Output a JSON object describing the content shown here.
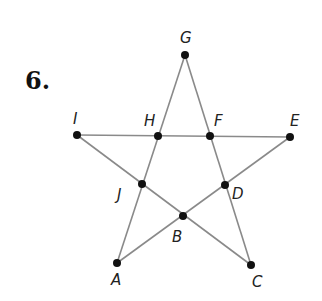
{
  "problem": {
    "number": "6."
  },
  "diagram": {
    "type": "pentagram",
    "line_color": "#8a8a8a",
    "point_color": "#111111",
    "points": [
      {
        "name": "G",
        "x": 185,
        "y": 55
      },
      {
        "name": "I",
        "x": 77,
        "y": 135
      },
      {
        "name": "H",
        "x": 158,
        "y": 136
      },
      {
        "name": "F",
        "x": 210,
        "y": 136
      },
      {
        "name": "E",
        "x": 290,
        "y": 137
      },
      {
        "name": "J",
        "x": 142,
        "y": 184
      },
      {
        "name": "D",
        "x": 225,
        "y": 185
      },
      {
        "name": "B",
        "x": 183,
        "y": 216
      },
      {
        "name": "A",
        "x": 117,
        "y": 263
      },
      {
        "name": "C",
        "x": 251,
        "y": 265
      }
    ],
    "segments": [
      [
        "G",
        "A"
      ],
      [
        "G",
        "C"
      ],
      [
        "I",
        "E"
      ],
      [
        "I",
        "C"
      ],
      [
        "A",
        "E"
      ]
    ],
    "labels": {
      "G": "G",
      "I": "I",
      "H": "H",
      "F": "F",
      "E": "E",
      "J": "J",
      "D": "D",
      "B": "B",
      "A": "A",
      "C": "C"
    }
  }
}
